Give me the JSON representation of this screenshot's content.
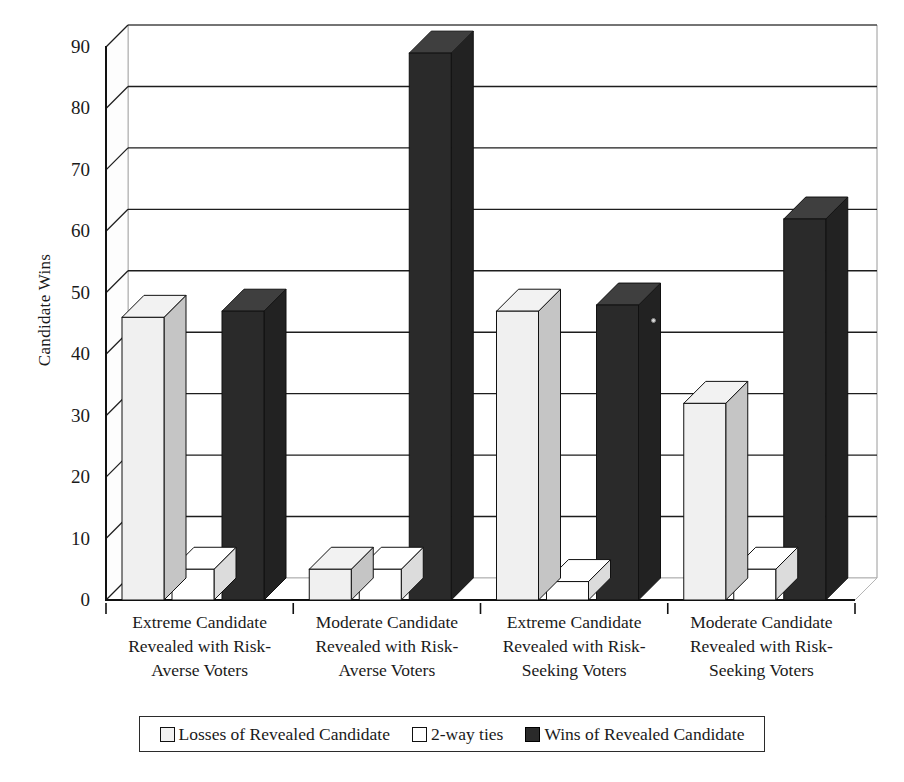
{
  "chart_data": {
    "type": "bar",
    "title": "",
    "xlabel": "",
    "ylabel": "Candidate Wins",
    "ylim": [
      0,
      90
    ],
    "ystep": 10,
    "ytick_labels": [
      "0",
      "10",
      "20",
      "30",
      "40",
      "50",
      "60",
      "70",
      "80",
      "90"
    ],
    "grid": true,
    "legend_position": "bottom",
    "three_d": true,
    "categories": [
      "Extreme Candidate Revealed with Risk-Averse Voters",
      "Moderate Candidate Revealed with Risk-Averse Voters",
      "Extreme Candidate Revealed with Risk-Seeking Voters",
      "Moderate Candidate Revealed with Risk-Seeking Voters"
    ],
    "category_lines": [
      [
        "Extreme Candidate",
        "Revealed with Risk-",
        "Averse Voters"
      ],
      [
        "Moderate Candidate",
        "Revealed with Risk-",
        "Averse Voters"
      ],
      [
        "Extreme Candidate",
        "Revealed with Risk-",
        "Seeking Voters"
      ],
      [
        "Moderate Candidate",
        "Revealed with Risk-",
        "Seeking Voters"
      ]
    ],
    "series": [
      {
        "name": "Losses of Revealed Candidate",
        "color": "#f0f0f0",
        "values": [
          46,
          5,
          47,
          32
        ]
      },
      {
        "name": "2-way ties",
        "color": "#ffffff",
        "values": [
          5,
          5,
          3,
          5
        ]
      },
      {
        "name": "Wins of Revealed Candidate",
        "color": "#2a2a2a",
        "values": [
          47,
          89,
          48,
          62
        ]
      }
    ]
  },
  "legend": {
    "items": [
      {
        "label": "Losses of Revealed Candidate",
        "swatch": "losses-swatch"
      },
      {
        "label": "2-way ties",
        "swatch": "ties-swatch"
      },
      {
        "label": "Wins of Revealed Candidate",
        "swatch": "wins-swatch"
      }
    ]
  },
  "axis": {
    "y_title": "Candidate Wins"
  }
}
